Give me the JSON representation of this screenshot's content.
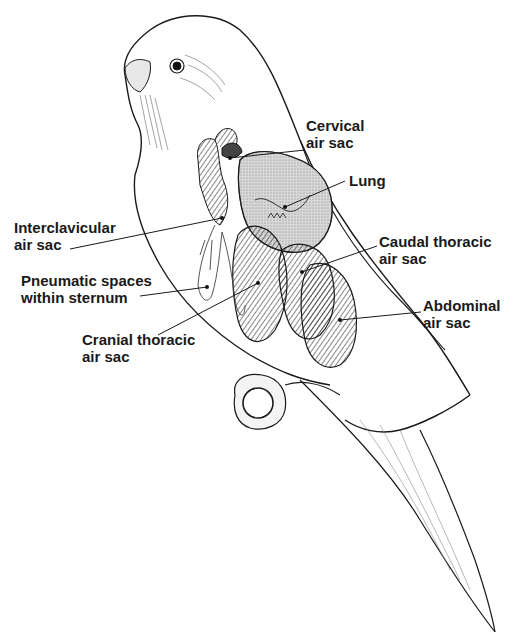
{
  "diagram": {
    "labels": [
      {
        "id": "cervical",
        "line1": "Cervical",
        "line2": "air sac"
      },
      {
        "id": "lung",
        "line1": "Lung",
        "line2": ""
      },
      {
        "id": "interclavicular",
        "line1": "Interclavicular",
        "line2": "air sac"
      },
      {
        "id": "caudal-thoracic",
        "line1": "Caudal thoracic",
        "line2": "air sac"
      },
      {
        "id": "pneumatic",
        "line1": "Pneumatic spaces",
        "line2": "within sternum"
      },
      {
        "id": "abdominal",
        "line1": "Abdominal",
        "line2": "air sac"
      },
      {
        "id": "cranial-thoracic",
        "line1": "Cranial thoracic",
        "line2": "air sac"
      }
    ],
    "colors": {
      "ink": "#1a1a1a",
      "background": "#ffffff",
      "lung_shade": "#d8d8d8"
    }
  }
}
